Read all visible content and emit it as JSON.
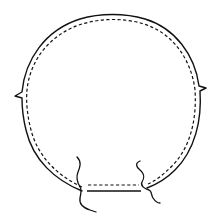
{
  "diagram": {
    "type": "sewing-pattern-piece",
    "shape": "circle",
    "stroke_color": "#111111",
    "background": "#ffffff",
    "elements": {
      "cut_line": "solid outline",
      "seam_line": "dashed inner outline",
      "notches": [
        "left-notch",
        "right-notch"
      ],
      "break_lines": [
        "left-break-line",
        "right-break-line"
      ],
      "bottom_opening": "straight edge between break lines"
    }
  }
}
